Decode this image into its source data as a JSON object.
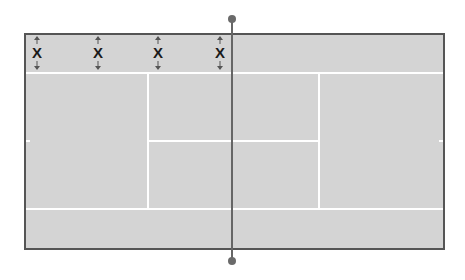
{
  "diagram": {
    "type": "tennis-court-top-view",
    "court_color": "#d4d4d4",
    "line_color": "#ffffff",
    "border_color": "#555555",
    "net_color": "#666666",
    "markers": [
      {
        "label": "X",
        "x": 36
      },
      {
        "label": "X",
        "x": 97
      },
      {
        "label": "X",
        "x": 157
      },
      {
        "label": "X",
        "x": 219
      }
    ],
    "marker_arrows": "vertical double-headed arrows above and below each X"
  }
}
